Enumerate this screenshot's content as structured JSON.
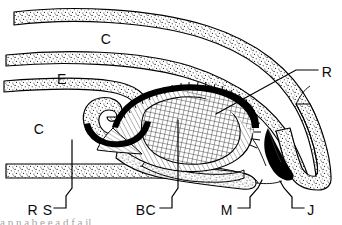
{
  "figure": {
    "type": "labelled line drawing",
    "width": 342,
    "height": 225,
    "background_color": "#ffffff",
    "ink_color": "#000000",
    "stipple_color": "#1a1a1a",
    "hatch_color": "#2a2a2a"
  },
  "labels": [
    {
      "id": "c-upper",
      "text": "C",
      "x": 106,
      "y": 39,
      "name": "label-c-upper"
    },
    {
      "id": "e",
      "text": "E",
      "x": 62,
      "y": 79,
      "name": "label-e"
    },
    {
      "id": "c-lower",
      "text": "C",
      "x": 39,
      "y": 129,
      "name": "label-c-lower"
    },
    {
      "id": "r",
      "text": "R",
      "x": 327,
      "y": 72,
      "name": "label-r"
    },
    {
      "id": "rs",
      "text": "R S",
      "x": 40,
      "y": 210,
      "name": "label-rs"
    },
    {
      "id": "bc",
      "text": "BC",
      "x": 146,
      "y": 210,
      "name": "label-bc"
    },
    {
      "id": "m",
      "text": "M",
      "x": 227,
      "y": 210,
      "name": "label-m"
    },
    {
      "id": "j",
      "text": "J",
      "x": 311,
      "y": 210,
      "name": "label-j"
    }
  ],
  "leaders": [
    {
      "id": "leader-r",
      "from_label": "R",
      "name": "leader-line-r"
    },
    {
      "id": "leader-rs",
      "from_label": "R S",
      "name": "leader-line-rs"
    },
    {
      "id": "leader-bc",
      "from_label": "BC",
      "name": "leader-line-bc"
    },
    {
      "id": "leader-m",
      "from_label": "M",
      "name": "leader-line-m"
    },
    {
      "id": "leader-j",
      "from_label": "J",
      "name": "leader-line-j"
    }
  ],
  "caption": {
    "text": "a p n a b e e a d f a il"
  }
}
